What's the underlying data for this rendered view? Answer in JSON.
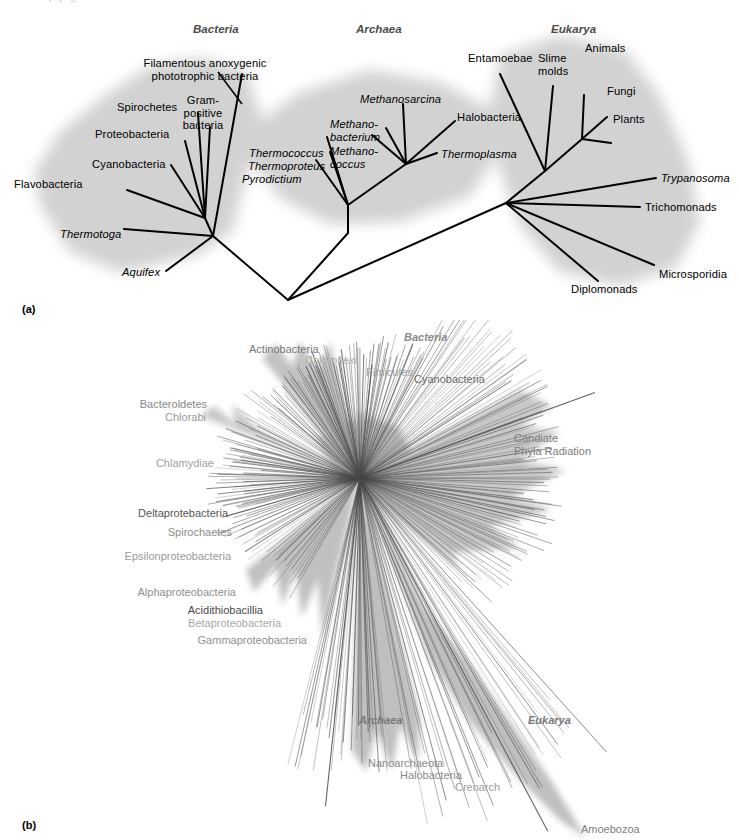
{
  "figure": {
    "cut_header_fragment": "…phylogenetic trees…",
    "panel_a_letter": "(a)",
    "panel_b_letter": "(b)"
  },
  "panel_a": {
    "domains": [
      {
        "name": "Bacteria",
        "x": 193,
        "y": 22
      },
      {
        "name": "Archaea",
        "x": 356,
        "y": 22
      },
      {
        "name": "Eukarya",
        "x": 551,
        "y": 22
      }
    ],
    "labels": [
      {
        "text": "Filamentous anoxygenic\nphototrophic bacteria",
        "x": 180,
        "y": 57,
        "align": "center",
        "italic": false
      },
      {
        "text": "Gram-\npositive\nbacteria",
        "x": 178,
        "y": 94,
        "align": "center",
        "italic": false
      },
      {
        "text": "Spirochetes",
        "x": 117,
        "y": 101,
        "align": "left",
        "italic": false
      },
      {
        "text": "Proteobacteria",
        "x": 95,
        "y": 128,
        "align": "left",
        "italic": false
      },
      {
        "text": "Cyanobacteria",
        "x": 92,
        "y": 158,
        "align": "left",
        "italic": false
      },
      {
        "text": "Flavobacteria",
        "x": 14,
        "y": 178,
        "align": "left",
        "italic": false
      },
      {
        "text": "Thermotoga",
        "x": 60,
        "y": 228,
        "align": "left",
        "italic": true
      },
      {
        "text": "Aquifex",
        "x": 122,
        "y": 266,
        "align": "left",
        "italic": true
      },
      {
        "text": "Thermococcus",
        "x": 249,
        "y": 147,
        "align": "left",
        "italic": true
      },
      {
        "text": "Thermoproteus",
        "x": 248,
        "y": 160,
        "align": "left",
        "italic": true
      },
      {
        "text": "Pyrodictium",
        "x": 242,
        "y": 173,
        "align": "left",
        "italic": true
      },
      {
        "text": "Methano-\ncoccus",
        "x": 330,
        "y": 145,
        "align": "left",
        "italic": true
      },
      {
        "text": "Methano-\nbacterium",
        "x": 330,
        "y": 118,
        "align": "left",
        "italic": true
      },
      {
        "text": "Methanosarcina",
        "x": 360,
        "y": 93,
        "align": "left",
        "italic": true
      },
      {
        "text": "Halobacteria",
        "x": 457,
        "y": 111,
        "align": "left",
        "italic": false
      },
      {
        "text": "Thermoplasma",
        "x": 441,
        "y": 148,
        "align": "left",
        "italic": true
      },
      {
        "text": "Entamoebae",
        "x": 468,
        "y": 52,
        "align": "left",
        "italic": false
      },
      {
        "text": "Slime\nmolds",
        "x": 538,
        "y": 52,
        "align": "left",
        "italic": false
      },
      {
        "text": "Animals",
        "x": 585,
        "y": 42,
        "align": "left",
        "italic": false
      },
      {
        "text": "Fungi",
        "x": 607,
        "y": 85,
        "align": "left",
        "italic": false
      },
      {
        "text": "Plants",
        "x": 613,
        "y": 113,
        "align": "left",
        "italic": false
      },
      {
        "text": "Trypanosoma",
        "x": 661,
        "y": 172,
        "align": "left",
        "italic": true
      },
      {
        "text": "Trichomonads",
        "x": 645,
        "y": 201,
        "align": "left",
        "italic": false
      },
      {
        "text": "Microsporidia",
        "x": 659,
        "y": 268,
        "align": "left",
        "italic": false
      },
      {
        "text": "Diplomonads",
        "x": 571,
        "y": 283,
        "align": "left",
        "italic": false
      }
    ]
  },
  "panel_b": {
    "labels": [
      {
        "text": "Bacteria",
        "x": 404,
        "y": 331,
        "align": "left",
        "italic": true,
        "color": "#8a8a8a"
      },
      {
        "text": "Actinobacteria",
        "x": 249,
        "y": 343,
        "align": "left",
        "italic": false,
        "color": "#777777"
      },
      {
        "text": "Chloroflexi",
        "x": 305,
        "y": 354,
        "align": "left",
        "italic": false,
        "color": "#b2b2b2"
      },
      {
        "text": "Fimicutes",
        "x": 366,
        "y": 366,
        "align": "left",
        "italic": false,
        "color": "#a0a0a0"
      },
      {
        "text": "Cyanobacteria",
        "x": 414,
        "y": 373,
        "align": "left",
        "italic": false,
        "color": "#6e6e6e"
      },
      {
        "text": "Bacteroldetes",
        "x": 207,
        "y": 398,
        "align": "right",
        "italic": false,
        "color": "#888888"
      },
      {
        "text": "Chlorabi",
        "x": 206,
        "y": 411,
        "align": "right",
        "italic": false,
        "color": "#999999"
      },
      {
        "text": "Chlamydiae",
        "x": 214,
        "y": 457,
        "align": "right",
        "italic": false,
        "color": "#a2a2a2"
      },
      {
        "text": "Candiate\nPhyla Radiation",
        "x": 514,
        "y": 432,
        "align": "left",
        "italic": false,
        "color": "#7d7d7d"
      },
      {
        "text": "Deltaprotebacteria",
        "x": 228,
        "y": 507,
        "align": "right",
        "italic": false,
        "color": "#555555"
      },
      {
        "text": "Spirochaetes",
        "x": 232,
        "y": 526,
        "align": "right",
        "italic": false,
        "color": "#8c8c8c"
      },
      {
        "text": "Epsilonproteobacteria",
        "x": 231,
        "y": 550,
        "align": "right",
        "italic": false,
        "color": "#9a9a9a"
      },
      {
        "text": "Alphaproteobacteria",
        "x": 236,
        "y": 586,
        "align": "right",
        "italic": false,
        "color": "#909090"
      },
      {
        "text": "Acidithiobacillia",
        "x": 263,
        "y": 604,
        "align": "right",
        "italic": false,
        "color": "#4a4a4a"
      },
      {
        "text": "Betaproteobacteria",
        "x": 281,
        "y": 617,
        "align": "right",
        "italic": false,
        "color": "#a8a8a8"
      },
      {
        "text": "Gammaproteobacteria",
        "x": 307,
        "y": 634,
        "align": "right",
        "italic": false,
        "color": "#8f8f8f"
      },
      {
        "text": "Archaea",
        "x": 359,
        "y": 714,
        "align": "left",
        "italic": true,
        "color": "#787878"
      },
      {
        "text": "Eukarya",
        "x": 528,
        "y": 714,
        "align": "left",
        "italic": true,
        "color": "#787878"
      },
      {
        "text": "Nanoarchaeota",
        "x": 368,
        "y": 757,
        "align": "left",
        "italic": false,
        "color": "#8a8a8a"
      },
      {
        "text": "Halobacteria",
        "x": 400,
        "y": 769,
        "align": "left",
        "italic": false,
        "color": "#8a8a8a"
      },
      {
        "text": "Crenarch",
        "x": 455,
        "y": 781,
        "align": "left",
        "italic": false,
        "color": "#9c9c9c"
      },
      {
        "text": "Amoebozoa",
        "x": 581,
        "y": 823,
        "align": "left",
        "italic": false,
        "color": "#808080"
      }
    ]
  },
  "chart_data": {
    "type": "diagram",
    "panels": [
      {
        "id": "a",
        "subtitle": "Classic rRNA-based unrooted tree of the three domains",
        "style": "unrooted-cladogram-with-shaded-domain-clouds",
        "domains": [
          "Bacteria",
          "Archaea",
          "Eukarya"
        ],
        "root": {
          "x": 288,
          "y": 300
        },
        "taxa": {
          "Bacteria": [
            "Flavobacteria",
            "Cyanobacteria",
            "Proteobacteria",
            "Spirochetes",
            "Gram-positive bacteria",
            "Filamentous anoxygenic phototrophic bacteria",
            "Thermotoga",
            "Aquifex"
          ],
          "Archaea": [
            "Pyrodictium",
            "Thermoproteus",
            "Thermococcus",
            "Methanococcus",
            "Methanobacterium",
            "Methanosarcina",
            "Halobacteria",
            "Thermoplasma"
          ],
          "Eukarya": [
            "Entamoebae",
            "Slime molds",
            "Animals",
            "Fungi",
            "Plants",
            "Trypanosoma",
            "Trichomonads",
            "Microsporidia",
            "Diplomonads"
          ]
        }
      },
      {
        "id": "b",
        "subtitle": "Modern genome-based radial tree of life including the Candidate Phyla Radiation",
        "style": "radial-fan-unrooted-tree",
        "hub": {
          "x": 360,
          "y": 478
        },
        "domains": [
          "Bacteria",
          "Archaea",
          "Eukarya"
        ],
        "annotated_groups": [
          "Actinobacteria",
          "Chloroflexi",
          "Fimicutes",
          "Cyanobacteria",
          "Bacteroldetes",
          "Chlorabi",
          "Chlamydiae",
          "Candiate Phyla Radiation",
          "Deltaprotebacteria",
          "Spirochaetes",
          "Epsilonproteobacteria",
          "Alphaproteobacteria",
          "Acidithiobacillia",
          "Betaproteobacteria",
          "Gammaproteobacteria",
          "Nanoarchaeota",
          "Halobacteria",
          "Crenarch",
          "Amoebozoa"
        ]
      }
    ],
    "colors": {
      "branch": "#000000",
      "domain_header": "#4c4c4c",
      "shade_cloud": "#d4d4d4",
      "panel_b_branch": "#555555",
      "panel_b_label_dark": "#555555",
      "panel_b_label_light": "#b2b2b2"
    }
  }
}
